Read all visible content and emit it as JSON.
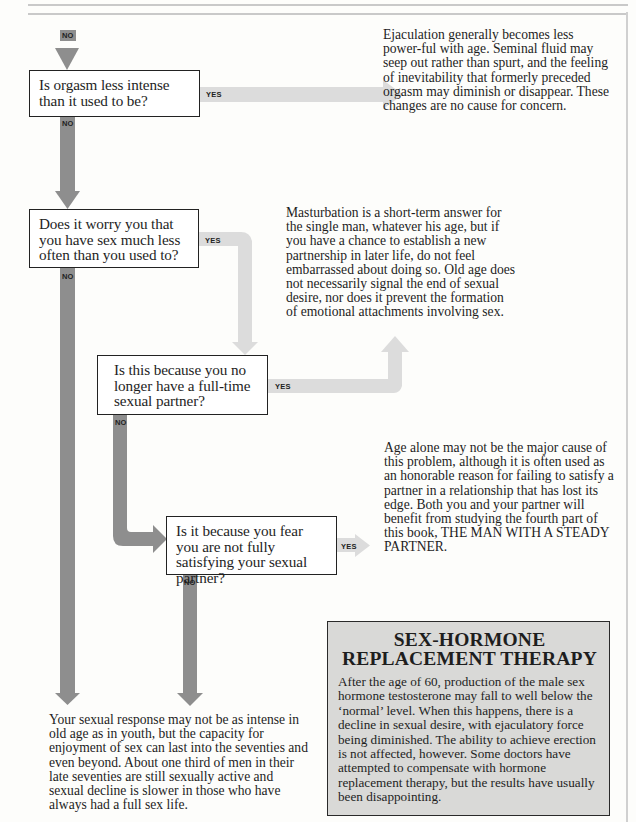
{
  "flowchart": {
    "entry_label": "NO",
    "questions": [
      {
        "id": "q1",
        "text": "Is orgasm less intense than it used to be?",
        "yes_label": "YES",
        "no_label": "NO"
      },
      {
        "id": "q2",
        "text": "Does it worry you that you have sex much less often than you used to?",
        "yes_label": "YES",
        "no_label": "NO"
      },
      {
        "id": "q3",
        "text": "Is this because you no longer have a full-time sexual partner?",
        "yes_label": "YES",
        "no_label": "NO"
      },
      {
        "id": "q4",
        "text": "Is it because you fear you are not fully satisfying your sexual partner?",
        "yes_label": "YES",
        "no_label": "NO"
      }
    ],
    "answers": {
      "ejaculation": "Ejaculation generally becomes less power-ful with age. Seminal fluid may seep out rather than spurt, and the feeling of inevitability that formerly preceded orgasm may diminish or disappear. These changes are no cause for concern.",
      "masturbation": "Masturbation is a short-term answer for the single man, whatever his age, but if you have a chance to establish a new partnership in later life, do not feel embarrassed about doing so. Old age does not necessarily signal the end of sexual desire, nor does it prevent the formation of emotional attachments involving sex.",
      "age_alone": "Age alone may not be the major cause of this problem, although it is often used as an honorable reason for failing to satisfy a partner in a relationship that has lost its edge. Both you and your partner will benefit from studying the fourth part of this book, THE MAN WITH A STEADY PARTNER.",
      "sexual_response": "Your sexual response may not be as intense in old age as in youth, but the capacity for enjoyment of sex can last into the seventies and even beyond. About one third of men in their late seventies are still sexually active and sexual decline is slower in those who have always had a full sex life."
    }
  },
  "sidebar_box": {
    "title_line1": "SEX-HORMONE",
    "title_line2": "REPLACEMENT THERAPY",
    "body": "After the age of 60, production of the male sex hormone testosterone may fall to well below the ‘normal’ level. When this happens, there is a decline in sexual desire, with ejaculatory force being diminished. The ability to achieve erection is not affected, however. Some doctors have attempted to compensate with hormone replacement therapy, but the results have usually been disappointing."
  },
  "colors": {
    "no_arrow": "#8e8e8e",
    "yes_arrow": "#dcdcdc",
    "sidebar_bg": "#d9d9d7",
    "box_border": "#222222"
  }
}
